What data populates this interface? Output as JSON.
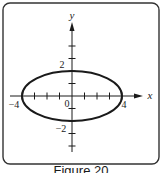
{
  "figure": {
    "caption": "Figure 20",
    "frame": {
      "x": 3,
      "y": 3,
      "width": 156,
      "height": 161,
      "radius": 7
    },
    "colors": {
      "stroke": "#1a1a1a",
      "frame": "#333333",
      "background": "#ffffff"
    }
  },
  "axes": {
    "origin_px": {
      "x": 72,
      "y": 96
    },
    "unit_px": 12.5,
    "x_axis": {
      "label": "x",
      "from_px": 10,
      "to_px": 143
    },
    "y_axis": {
      "label": "y",
      "from_px": 152,
      "to_px": 22
    },
    "x_ticks": [
      -4,
      -3,
      -2,
      -1,
      1,
      2,
      3,
      4
    ],
    "y_ticks": [
      -4,
      -3,
      -2,
      -1,
      1,
      2,
      3,
      4
    ],
    "labels": {
      "x_neg4": "−4",
      "x_pos4": "4",
      "y_pos2": "2",
      "y_neg2": "−2",
      "origin": "0"
    }
  },
  "chart_data": {
    "type": "line",
    "title": "Figure 20",
    "xlabel": "x",
    "ylabel": "y",
    "series": [
      {
        "name": "ellipse",
        "equation": "x^2/16 + y^2/4 = 1",
        "center": [
          0,
          0
        ],
        "semi_major_x": 4,
        "semi_minor_y": 2,
        "vertices": [
          [
            -4,
            0
          ],
          [
            4,
            0
          ]
        ],
        "co_vertices": [
          [
            0,
            2
          ],
          [
            0,
            -2
          ]
        ]
      }
    ],
    "xlim": [
      -5,
      5.5
    ],
    "ylim": [
      -4.5,
      6
    ],
    "tick_labels": {
      "x": [
        "-4",
        "0",
        "4"
      ],
      "y": [
        "2",
        "-2"
      ]
    },
    "grid": false
  }
}
